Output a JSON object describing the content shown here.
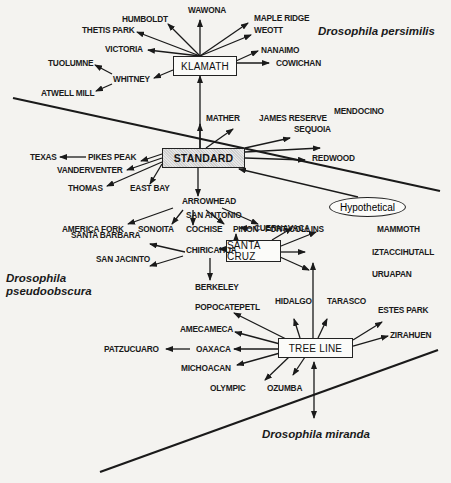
{
  "species": {
    "persimilis": "Drosophila persimilis",
    "pseudoobscura_line1": "Drosophila",
    "pseudoobscura_line2": "pseudoobscura",
    "miranda": "Drosophila miranda"
  },
  "hubs": {
    "klamath": "KLAMATH",
    "standard": "STANDARD",
    "santa_cruz": "SANTA CRUZ",
    "tree_line": "TREE LINE",
    "hypothetical": "Hypothetical",
    "arrowhead": "ARROWHEAD",
    "chiricahua": "CHIRICAHUA",
    "whitney": "WHITNEY",
    "pikes_peak": "PIKES PEAK",
    "cuernavaca": "CUERNAVACA",
    "oaxaca": "OAXACA"
  },
  "labels": {
    "wawona": "WAWONA",
    "humboldt": "HUMBOLDT",
    "maple_ridge": "MAPLE RIDGE",
    "thetis_park": "THETIS PARK",
    "weott": "WEOTT",
    "victoria": "VICTORIA",
    "nanaimo": "NANAIMO",
    "cowichan": "COWICHAN",
    "tuolumne": "TUOLUMNE",
    "atwell_mill": "ATWELL MILL",
    "mather": "MATHER",
    "james_reserve": "JAMES RESERVE",
    "sequoia": "SEQUOIA",
    "mendocino": "MENDOCINO",
    "redwood": "REDWOOD",
    "texas": "TEXAS",
    "vanderventer": "VANDERVENTER",
    "thomas": "THOMAS",
    "east_bay": "EAST BAY",
    "america_fork": "AMERICA FORK",
    "sonoita": "SONOITA",
    "cochise": "COCHISE",
    "pinon": "PINON",
    "fort_collins": "FORT COLLINS",
    "san_antonio": "SAN ANTONIO",
    "santa_barbara": "SANTA BARBARA",
    "san_jacinto": "SAN JACINTO",
    "berkeley": "BERKELEY",
    "mammoth": "MAMMOTH",
    "iztaccihutall": "IZTACCIHUTALL",
    "uruapan": "URUAPAN",
    "popocatepetl": "POPOCATEPETL",
    "hidalgo": "HIDALGO",
    "tarasco": "TARASCO",
    "estes_park": "ESTES PARK",
    "amecameca": "AMECAMECA",
    "zirahuen": "ZIRAHUEN",
    "patzcuaro": "PATZUCUARO",
    "michoacan": "MICHOACAN",
    "olympic": "OLYMPIC",
    "ozumba": "OZUMBA"
  },
  "colors": {
    "ink": "#1a1a1a",
    "paper": "#f4f3f0",
    "standard_fill": "#d9d9d9"
  }
}
